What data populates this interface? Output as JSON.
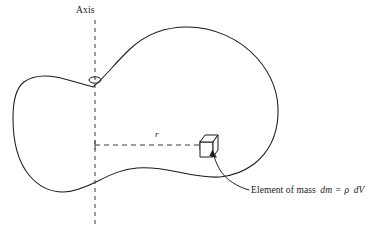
{
  "figure": {
    "type": "physics-diagram",
    "background_color": "#ffffff",
    "stroke_color": "#1a1a1a",
    "dash_color": "#3a3a3a"
  },
  "labels": {
    "axis": "Axis",
    "radius": "r",
    "element_prefix": "Element of mass",
    "element_dm": "dm",
    "element_equals": "=",
    "element_rho": "ρ",
    "element_dv": "dV"
  },
  "geometry": {
    "axis_line": {
      "x": 95,
      "y_top": 20,
      "y_bottom": 228,
      "dash": "4 4"
    },
    "radius_line": {
      "x_start": 95,
      "x_end": 200,
      "y": 145,
      "dash": "5 4"
    },
    "pierce_marker": {
      "cx": 95,
      "cy": 80,
      "rx": 6,
      "ry": 3.2
    },
    "cube": {
      "cx": 209,
      "cy": 146,
      "size": 15
    },
    "leader": {
      "from_x": 249,
      "from_y": 191,
      "to_x": 213,
      "to_y": 152
    }
  }
}
